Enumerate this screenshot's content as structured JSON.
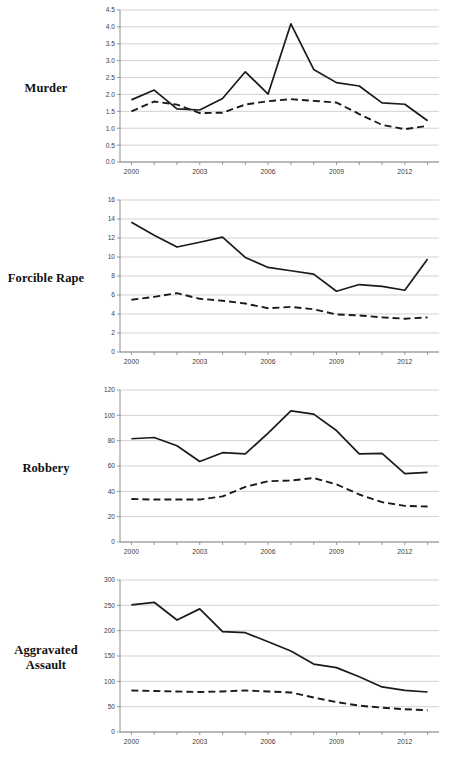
{
  "figure": {
    "width": 449,
    "height": 762,
    "background": "#ffffff",
    "grid_color": "#bfbfbf",
    "axis_color": "#808080",
    "series_color": "#1a1a1a"
  },
  "panels": [
    {
      "label": "Murder"
    },
    {
      "label": "Forcible Rape"
    },
    {
      "label": "Robbery"
    },
    {
      "label": "Aggravated\nAssault"
    }
  ],
  "chart_data": [
    {
      "type": "line",
      "title": "Murder",
      "xlabel": "",
      "ylabel": "",
      "x": [
        2000,
        2001,
        2002,
        2003,
        2004,
        2005,
        2006,
        2007,
        2008,
        2009,
        2010,
        2011,
        2012,
        2013
      ],
      "xlim": [
        1999.5,
        2013.5
      ],
      "ylim": [
        0.0,
        4.5
      ],
      "yticks": [
        0.0,
        0.5,
        1.0,
        1.5,
        2.0,
        2.5,
        3.0,
        3.5,
        4.0,
        4.5
      ],
      "ytick_labels": [
        "0.0",
        "0.5",
        "1.0",
        "1.5",
        "2.0",
        "2.5",
        "3.0",
        "3.5",
        "4.0",
        "4.5"
      ],
      "xticks": [
        2000,
        2003,
        2006,
        2009,
        2012
      ],
      "xtick_labels": [
        "2000",
        "2003",
        "2006",
        "2009",
        "2012"
      ],
      "grid": true,
      "legend": "none",
      "series": [
        {
          "name": "solid",
          "style": "solid",
          "values": [
            1.84,
            2.13,
            1.57,
            1.54,
            1.88,
            2.67,
            2.01,
            4.09,
            2.74,
            2.35,
            2.25,
            1.75,
            1.71,
            1.22
          ]
        },
        {
          "name": "dashed",
          "style": "dashed",
          "values": [
            1.5,
            1.79,
            1.7,
            1.45,
            1.46,
            1.7,
            1.8,
            1.86,
            1.81,
            1.76,
            1.42,
            1.1,
            0.97,
            1.07
          ]
        }
      ]
    },
    {
      "type": "line",
      "title": "Forcible Rape",
      "xlabel": "",
      "ylabel": "",
      "x": [
        2000,
        2001,
        2002,
        2003,
        2004,
        2005,
        2006,
        2007,
        2008,
        2009,
        2010,
        2011,
        2012,
        2013
      ],
      "xlim": [
        1999.5,
        2013.5
      ],
      "ylim": [
        0,
        16
      ],
      "yticks": [
        0,
        2,
        4,
        6,
        8,
        10,
        12,
        14,
        16
      ],
      "ytick_labels": [
        "0",
        "2",
        "4",
        "6",
        "8",
        "10",
        "12",
        "14",
        "16"
      ],
      "xticks": [
        2000,
        2003,
        2006,
        2009,
        2012
      ],
      "xtick_labels": [
        "2000",
        "2003",
        "2006",
        "2009",
        "2012"
      ],
      "grid": true,
      "legend": "none",
      "series": [
        {
          "name": "solid",
          "style": "solid",
          "values": [
            13.65,
            12.3,
            11.05,
            11.55,
            12.1,
            9.95,
            8.9,
            8.55,
            8.2,
            6.4,
            7.1,
            6.9,
            6.5,
            9.8
          ]
        },
        {
          "name": "dashed",
          "style": "dashed",
          "values": [
            5.5,
            5.8,
            6.2,
            5.6,
            5.4,
            5.1,
            4.6,
            4.75,
            4.5,
            3.95,
            3.85,
            3.65,
            3.5,
            3.65
          ]
        }
      ]
    },
    {
      "type": "line",
      "title": "Robbery",
      "xlabel": "",
      "ylabel": "",
      "x": [
        2000,
        2001,
        2002,
        2003,
        2004,
        2005,
        2006,
        2007,
        2008,
        2009,
        2010,
        2011,
        2012,
        2013
      ],
      "xlim": [
        1999.5,
        2013.5
      ],
      "ylim": [
        0,
        120
      ],
      "yticks": [
        0,
        20,
        40,
        60,
        80,
        100,
        120
      ],
      "ytick_labels": [
        "0",
        "20",
        "40",
        "60",
        "80",
        "100",
        "120"
      ],
      "xticks": [
        2000,
        2003,
        2006,
        2009,
        2012
      ],
      "xtick_labels": [
        "2000",
        "2003",
        "2006",
        "2009",
        "2012"
      ],
      "grid": true,
      "legend": "none",
      "series": [
        {
          "name": "solid",
          "style": "solid",
          "values": [
            81.5,
            82.5,
            76.0,
            63.5,
            70.5,
            69.5,
            86.0,
            103.5,
            101.0,
            88.0,
            69.5,
            70.0,
            54.0,
            55.0
          ]
        },
        {
          "name": "dashed",
          "style": "dashed",
          "values": [
            34.0,
            33.5,
            33.5,
            33.5,
            36.0,
            43.5,
            48.0,
            48.5,
            50.5,
            45.5,
            37.5,
            31.5,
            28.5,
            28.0
          ]
        }
      ]
    },
    {
      "type": "line",
      "title": "Aggravated Assault",
      "xlabel": "",
      "ylabel": "",
      "x": [
        2000,
        2001,
        2002,
        2003,
        2004,
        2005,
        2006,
        2007,
        2008,
        2009,
        2010,
        2011,
        2012,
        2013
      ],
      "xlim": [
        1999.5,
        2013.5
      ],
      "ylim": [
        0,
        300
      ],
      "yticks": [
        0,
        50,
        100,
        150,
        200,
        250,
        300
      ],
      "ytick_labels": [
        "0",
        "50",
        "100",
        "150",
        "200",
        "250",
        "300"
      ],
      "xticks": [
        2000,
        2003,
        2006,
        2009,
        2012
      ],
      "xtick_labels": [
        "2000",
        "2003",
        "2006",
        "2009",
        "2012"
      ],
      "grid": true,
      "legend": "none",
      "series": [
        {
          "name": "solid",
          "style": "solid",
          "values": [
            251,
            256,
            221,
            243,
            198,
            196,
            178,
            160,
            134,
            127,
            109,
            89,
            82,
            79
          ]
        },
        {
          "name": "dashed",
          "style": "dashed",
          "values": [
            82,
            81,
            80,
            79,
            80,
            82,
            80,
            78,
            68,
            59,
            52,
            48,
            45,
            43
          ]
        }
      ]
    }
  ]
}
